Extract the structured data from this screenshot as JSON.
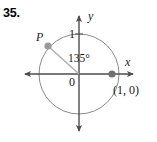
{
  "problem": {
    "number": "35."
  },
  "figure": {
    "type": "unit-circle-diagram",
    "axis_labels": {
      "x": "x",
      "y": "y"
    },
    "origin_label": "0",
    "y_tick_label": "1",
    "angle_label": "135°",
    "terminal_point_label": "P",
    "initial_point_label": "(1, 0)",
    "colors": {
      "circle_stroke": "#8a8a8a",
      "axis_stroke": "#4d4d4d",
      "radius_stroke": "#b3b3b3",
      "point_fill": "#9a9a9a",
      "text": "#1a1a1a"
    },
    "geometry": {
      "center_x": 79,
      "center_y": 74,
      "radius": 40,
      "angle_degrees": 135,
      "point_p_x": 48,
      "point_p_y": 46,
      "point_one_zero_x": 112,
      "point_one_zero_y": 74
    }
  }
}
